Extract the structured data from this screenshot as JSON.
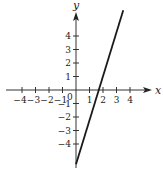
{
  "chart_data": {
    "type": "line",
    "title": "",
    "xlabel": "x",
    "ylabel": "y",
    "xlim": [
      -5.5,
      5.5
    ],
    "ylim": [
      -5.7,
      6.5
    ],
    "grid": false,
    "x_ticks": [
      -4,
      -3,
      -2,
      -1,
      1,
      2,
      3,
      4
    ],
    "x_tick_labels": [
      "−4",
      "−3",
      "−2",
      "−1",
      "1",
      "2",
      "3",
      "4"
    ],
    "y_ticks": [
      -4,
      -3,
      -2,
      -1,
      1,
      2,
      3,
      4
    ],
    "y_tick_labels": [
      "−4",
      "−3",
      "−2",
      "−1",
      "1",
      "2",
      "3",
      "4"
    ],
    "origin_label": "0",
    "series": [
      {
        "name": "line",
        "equation": "y = 3x - 5",
        "x": [
          0,
          3.5
        ],
        "y": [
          -5.5,
          5.9
        ],
        "color": "#1a1a1a"
      }
    ]
  },
  "layout": {
    "origin_px": [
      76,
      90
    ],
    "unit_px": 13.5
  }
}
